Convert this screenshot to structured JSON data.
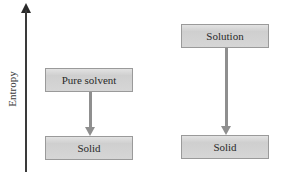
{
  "axis": {
    "label": "Entropy",
    "direction": "up"
  },
  "left_column": {
    "top_box": {
      "label": "Pure solvent"
    },
    "bottom_box": {
      "label": "Solid"
    }
  },
  "right_column": {
    "top_box": {
      "label": "Solution"
    },
    "bottom_box": {
      "label": "Solid"
    }
  },
  "colors": {
    "box_fill": "#d6d6d6",
    "box_border": "#9a9a9a",
    "arrow": "#8f8f8f",
    "axis": "#3a3a3a"
  }
}
